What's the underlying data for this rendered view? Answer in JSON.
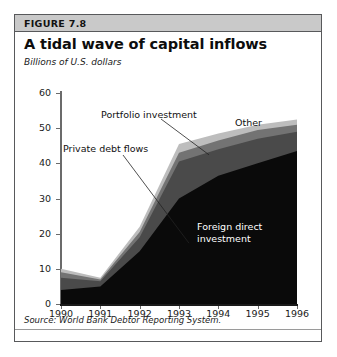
{
  "figure": {
    "number_label": "FIGURE 7.8",
    "title": "A tidal wave of capital inflows",
    "units_label": "Billions of U.S. dollars",
    "source": "Source: World Bank Debtor Reporting System."
  },
  "colors": {
    "header_band": "#c9c9c9",
    "border": "#58595b",
    "fdi": "#0a0a0a",
    "private_debt": "#4a4a4a",
    "portfolio": "#737373",
    "other": "#bdbdbd",
    "axis": "#1a1a1a"
  },
  "annotations": {
    "portfolio": "Portfolio investment",
    "private_debt": "Private debt flows",
    "other": "Other",
    "fdi_line1": "Foreign direct",
    "fdi_line2": "investment"
  },
  "chart_data": {
    "type": "area",
    "title": "A tidal wave of capital inflows",
    "subtitle": "Billions of U.S. dollars",
    "xlabel": "",
    "ylabel": "Billions of U.S. dollars",
    "stacked": true,
    "grid": false,
    "legend_position": "inline-annotations",
    "categories": [
      "1990",
      "1991",
      "1992",
      "1993",
      "1994",
      "1995",
      "1996"
    ],
    "x": [
      1990,
      1991,
      1992,
      1993,
      1994,
      1995,
      1996
    ],
    "xlim": [
      1990,
      1996
    ],
    "ylim": [
      0,
      60
    ],
    "yticks": [
      0,
      10,
      20,
      30,
      40,
      50,
      60
    ],
    "xticks": [
      "1990",
      "1991",
      "1992",
      "1993",
      "1994",
      "1995",
      "1996"
    ],
    "series": [
      {
        "name": "Foreign direct investment",
        "color": "#0a0a0a",
        "values": [
          4.0,
          5.0,
          15.0,
          30.0,
          36.5,
          40.0,
          43.5
        ]
      },
      {
        "name": "Private debt flows",
        "color": "#4a4a4a",
        "values": [
          3.5,
          1.5,
          4.0,
          10.5,
          7.5,
          7.0,
          5.5
        ]
      },
      {
        "name": "Portfolio investment",
        "color": "#737373",
        "values": [
          1.5,
          0.5,
          1.5,
          2.5,
          2.5,
          2.5,
          2.0
        ]
      },
      {
        "name": "Other",
        "color": "#bdbdbd",
        "values": [
          1.0,
          0.5,
          1.5,
          2.5,
          2.0,
          1.5,
          1.5
        ]
      }
    ],
    "cumulative_totals": [
      10.0,
      7.5,
      22.0,
      45.5,
      48.5,
      51.0,
      52.5
    ]
  }
}
